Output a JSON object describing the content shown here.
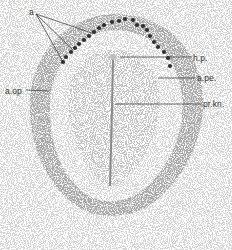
{
  "figure": {
    "colors": {
      "ink": "#333333",
      "dot": "#2f2f2f",
      "stipple": "#6a6a6a",
      "background": "#ffffff"
    },
    "labels": [
      {
        "id": "a",
        "text": "a",
        "x": 29,
        "y": 8
      },
      {
        "id": "hp",
        "text": "h.p.",
        "x": 193,
        "y": 54
      },
      {
        "id": "ape",
        "text": "a.pe.",
        "x": 197,
        "y": 74
      },
      {
        "id": "aop",
        "text": "a.op",
        "x": 5,
        "y": 87
      },
      {
        "id": "prkn",
        "text": "pr.kn.",
        "x": 203,
        "y": 100
      }
    ],
    "leader_lines": [
      {
        "for": "a",
        "x1": 36,
        "y1": 14,
        "x2": 63,
        "y2": 62
      },
      {
        "for": "a",
        "x1": 36,
        "y1": 14,
        "x2": 73,
        "y2": 50
      },
      {
        "for": "a",
        "x1": 36,
        "y1": 14,
        "x2": 92,
        "y2": 33
      },
      {
        "for": "hp",
        "x1": 120,
        "y1": 57,
        "x2": 192,
        "y2": 57
      },
      {
        "for": "ape",
        "x1": 158,
        "y1": 78,
        "x2": 195,
        "y2": 78
      },
      {
        "for": "aop",
        "x1": 26,
        "y1": 90,
        "x2": 49,
        "y2": 91
      },
      {
        "for": "prkn",
        "x1": 115,
        "y1": 104,
        "x2": 201,
        "y2": 104
      }
    ],
    "dots": [
      [
        63,
        62
      ],
      [
        66,
        57
      ],
      [
        71,
        52
      ],
      [
        75,
        48
      ],
      [
        79,
        44
      ],
      [
        84,
        40
      ],
      [
        89,
        36
      ],
      [
        94,
        32
      ],
      [
        99,
        28
      ],
      [
        104,
        25
      ],
      [
        112,
        22
      ],
      [
        119,
        21
      ],
      [
        125,
        19
      ],
      [
        133,
        20
      ],
      [
        137,
        25
      ],
      [
        143,
        26
      ],
      [
        147,
        30
      ],
      [
        150,
        36
      ],
      [
        154,
        42
      ],
      [
        158,
        47
      ],
      [
        164,
        52
      ],
      [
        168,
        58
      ],
      [
        170,
        66
      ]
    ],
    "streak": {
      "x1": 113,
      "y1": 57,
      "x2": 110,
      "y2": 186
    }
  }
}
